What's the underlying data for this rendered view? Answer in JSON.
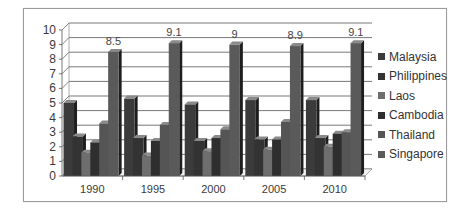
{
  "chart_data": {
    "type": "bar",
    "title": "",
    "xlabel": "",
    "ylabel": "",
    "ylim": [
      0,
      10
    ],
    "yticks": [
      0,
      1,
      2,
      3,
      4,
      5,
      6,
      7,
      8,
      9,
      10
    ],
    "grid": true,
    "legend_position": "right",
    "style": "3d-clustered-column",
    "categories": [
      "1990",
      "1995",
      "2000",
      "2005",
      "2010"
    ],
    "series": [
      {
        "name": "Malaysia",
        "color": "#3b3b3b",
        "values": [
          5.0,
          5.3,
          4.9,
          5.2,
          5.2
        ]
      },
      {
        "name": "Philippines",
        "color": "#333333",
        "values": [
          2.7,
          2.6,
          2.4,
          2.5,
          2.6
        ]
      },
      {
        "name": "Laos",
        "color": "#6e6e6e",
        "values": [
          1.6,
          1.4,
          1.7,
          1.8,
          2.0
        ]
      },
      {
        "name": "Cambodia",
        "color": "#2e2e2e",
        "values": [
          2.3,
          2.4,
          2.6,
          2.5,
          2.9
        ]
      },
      {
        "name": "Thailand",
        "color": "#555555",
        "values": [
          3.6,
          3.5,
          3.2,
          3.7,
          3.0
        ]
      },
      {
        "name": "Singapore",
        "color": "#5a5a5a",
        "values": [
          8.5,
          9.1,
          9.0,
          8.9,
          9.1
        ]
      }
    ],
    "data_labels": {
      "series": "Singapore",
      "labels": [
        "8.5",
        "9.1",
        "9",
        "8.9",
        "9.1"
      ]
    }
  }
}
